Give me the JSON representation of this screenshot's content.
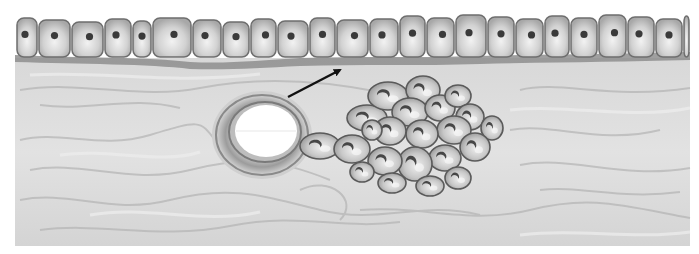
{
  "figure": {
    "colors": {
      "background": "#ffffff",
      "tissue": "#dcdcdc",
      "tissue_fiber": "#b8b8b8",
      "cell_fill": "#d6d6d6",
      "cell_border": "#6e6e6e",
      "nucleus": "#3a3a3a",
      "membrane": "#8a8a8a",
      "vessel_wall": "#9a9a9a",
      "lumen": "#ffffff",
      "arrow": "#111111"
    },
    "arrow": {
      "x1": 288,
      "y1": 97,
      "x2": 340,
      "y2": 70
    },
    "vessel": {
      "cx": 262,
      "cy": 135,
      "outer_rx": 48,
      "outer_ry": 42,
      "lumen_cx": 266,
      "lumen_cy": 131,
      "lumen_rx": 32,
      "lumen_ry": 27
    },
    "epithelial_cells": [
      {
        "x": 16,
        "w": 22
      },
      {
        "x": 38,
        "w": 33
      },
      {
        "x": 71,
        "w": 33
      },
      {
        "x": 104,
        "w": 28
      },
      {
        "x": 132,
        "w": 20
      },
      {
        "x": 152,
        "w": 40
      },
      {
        "x": 192,
        "w": 30
      },
      {
        "x": 222,
        "w": 28
      },
      {
        "x": 250,
        "w": 27
      },
      {
        "x": 277,
        "w": 32
      },
      {
        "x": 309,
        "w": 27
      },
      {
        "x": 336,
        "w": 33
      },
      {
        "x": 369,
        "w": 30
      },
      {
        "x": 399,
        "w": 27
      },
      {
        "x": 426,
        "w": 29
      },
      {
        "x": 455,
        "w": 32
      },
      {
        "x": 487,
        "w": 28
      },
      {
        "x": 515,
        "w": 29
      },
      {
        "x": 544,
        "w": 26
      },
      {
        "x": 570,
        "w": 28
      },
      {
        "x": 598,
        "w": 29
      },
      {
        "x": 627,
        "w": 28
      },
      {
        "x": 655,
        "w": 28
      },
      {
        "x": 683,
        "w": 7
      }
    ],
    "cluster_cells": [
      {
        "cx": 320,
        "cy": 146,
        "rx": 20,
        "ry": 13
      },
      {
        "cx": 352,
        "cy": 149,
        "rx": 18,
        "ry": 14
      },
      {
        "cx": 367,
        "cy": 118,
        "rx": 20,
        "ry": 13
      },
      {
        "cx": 388,
        "cy": 96,
        "rx": 20,
        "ry": 14
      },
      {
        "cx": 423,
        "cy": 90,
        "rx": 17,
        "ry": 14
      },
      {
        "cx": 410,
        "cy": 112,
        "rx": 18,
        "ry": 14
      },
      {
        "cx": 440,
        "cy": 108,
        "rx": 15,
        "ry": 13
      },
      {
        "cx": 458,
        "cy": 96,
        "rx": 13,
        "ry": 11
      },
      {
        "cx": 470,
        "cy": 117,
        "rx": 14,
        "ry": 13
      },
      {
        "cx": 492,
        "cy": 128,
        "rx": 11,
        "ry": 12
      },
      {
        "cx": 454,
        "cy": 130,
        "rx": 17,
        "ry": 14
      },
      {
        "cx": 422,
        "cy": 134,
        "rx": 16,
        "ry": 14
      },
      {
        "cx": 390,
        "cy": 131,
        "rx": 16,
        "ry": 14
      },
      {
        "cx": 372,
        "cy": 130,
        "rx": 10,
        "ry": 10
      },
      {
        "cx": 475,
        "cy": 147,
        "rx": 15,
        "ry": 14
      },
      {
        "cx": 445,
        "cy": 158,
        "rx": 16,
        "ry": 13
      },
      {
        "cx": 415,
        "cy": 164,
        "rx": 17,
        "ry": 17
      },
      {
        "cx": 385,
        "cy": 161,
        "rx": 17,
        "ry": 14
      },
      {
        "cx": 362,
        "cy": 172,
        "rx": 12,
        "ry": 10
      },
      {
        "cx": 392,
        "cy": 183,
        "rx": 14,
        "ry": 10
      },
      {
        "cx": 430,
        "cy": 186,
        "rx": 14,
        "ry": 10
      },
      {
        "cx": 458,
        "cy": 178,
        "rx": 13,
        "ry": 11
      }
    ]
  }
}
